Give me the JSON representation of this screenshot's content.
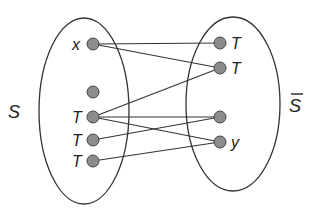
{
  "diagram": {
    "left_set": {
      "label": "S",
      "cx": 84,
      "cy": 111,
      "rx": 45,
      "ry": 93
    },
    "right_set": {
      "label": "S",
      "overline": true,
      "cx": 233,
      "cy": 104,
      "rx": 47,
      "ry": 87
    },
    "left_nodes": [
      {
        "id": "L1",
        "label": "x",
        "x": 93,
        "y": 44
      },
      {
        "id": "L2",
        "label": "",
        "x": 93,
        "y": 92
      },
      {
        "id": "L3",
        "label": "T",
        "x": 93,
        "y": 117
      },
      {
        "id": "L4",
        "label": "T",
        "x": 93,
        "y": 140
      },
      {
        "id": "L5",
        "label": "T",
        "x": 93,
        "y": 161
      }
    ],
    "right_nodes": [
      {
        "id": "R1",
        "label": "T",
        "x": 220,
        "y": 43
      },
      {
        "id": "R2",
        "label": "T",
        "x": 220,
        "y": 68
      },
      {
        "id": "R3",
        "label": "",
        "x": 220,
        "y": 117
      },
      {
        "id": "R4",
        "label": "y",
        "x": 220,
        "y": 142
      }
    ],
    "edges": [
      [
        "L1",
        "R1"
      ],
      [
        "L1",
        "R2"
      ],
      [
        "L3",
        "R2"
      ],
      [
        "L3",
        "R3"
      ],
      [
        "L3",
        "R4"
      ],
      [
        "L4",
        "R3"
      ],
      [
        "L5",
        "R4"
      ]
    ],
    "node_color": "#8c8c8c",
    "stroke_color": "#333333"
  }
}
